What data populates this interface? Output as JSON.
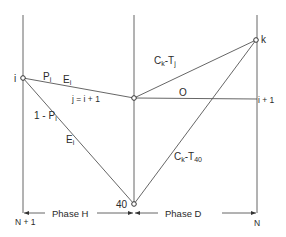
{
  "diagram": {
    "nodes": {
      "i": {
        "label": "i",
        "x": 23,
        "y": 78
      },
      "j": {
        "label": "",
        "x": 134,
        "y": 98
      },
      "k": {
        "label": "k",
        "x": 256,
        "y": 40
      },
      "n40": {
        "label": "40",
        "x": 134,
        "y": 204
      }
    },
    "edges": {
      "i_j": {
        "label_p": "P",
        "label_p_sub": "i",
        "label_e": "E",
        "label_e_sub": "i",
        "label_j": "j = i + 1"
      },
      "i_40": {
        "label_top": "1 - P",
        "label_top_sub": "i",
        "label_bottom": "E",
        "label_bottom_sub": "i"
      },
      "j_k": {
        "label": "C",
        "label_sub1": "k",
        "label_mid": "-T",
        "label_sub2": "j"
      },
      "j_i1": {
        "label": "O",
        "end_label": "i + 1"
      },
      "n40_k": {
        "label": "C",
        "label_sub1": "k",
        "label_mid": "-T",
        "label_sub2": "40"
      }
    },
    "axis": {
      "left_label": "N + 1",
      "right_label": "N",
      "phase_h": "Phase H",
      "phase_d": "Phase D"
    },
    "colors": {
      "line": "#555555",
      "text": "#2a2a2a",
      "background": "#ffffff"
    }
  }
}
